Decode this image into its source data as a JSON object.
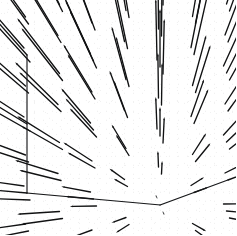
{
  "figure": {
    "kind": "3d-vector-field",
    "background_color": "#ffffff",
    "ink_color": "#111213",
    "width": 236,
    "height": 235
  },
  "axes": {
    "z": {
      "name": "z",
      "ticks": [
        "2",
        "1",
        "0",
        "-1",
        "-2"
      ],
      "tick_values": [
        2,
        1,
        0,
        -1,
        -2
      ],
      "range": [
        -2,
        2
      ],
      "minor_ticks_per_interval": 4
    },
    "y": {
      "name": "y",
      "ticks": [
        "-2",
        "-1",
        "0",
        "1",
        "2"
      ],
      "tick_values": [
        -2,
        -1,
        0,
        1,
        2
      ],
      "range": [
        -2,
        2
      ]
    },
    "x": {
      "name": "x",
      "ticks": [
        "2",
        "1",
        "0",
        "-1",
        "-2"
      ],
      "tick_values": [
        2,
        1,
        0,
        -1,
        -2
      ],
      "range": [
        -2,
        2
      ]
    }
  },
  "chart_data": {
    "type": "scatter",
    "title": "",
    "subtitle": "",
    "xlabel": "x",
    "ylabel": "y",
    "zlabel": "z",
    "xlim": [
      -2,
      2
    ],
    "ylim": [
      -2,
      2
    ],
    "zlim": [
      -2,
      2
    ],
    "grid": false,
    "legend": "none",
    "field": {
      "description": "3D vector field sampled on a regular cubic grid; arrows are short near the origin and grow toward the edges, pointing away from the centre (radially divergent).",
      "samples_per_axis": 9,
      "sample_coordinates": [
        -2,
        -1.5,
        -1,
        -0.5,
        0,
        0.5,
        1,
        1.5,
        2
      ],
      "vector_rule": "v(x,y,z) = (x, y, z)",
      "arrow_scale": 0.42,
      "total_arrows": 729
    },
    "tick_labels": {
      "x": [
        "2",
        "1",
        "0",
        "-1",
        "-2"
      ],
      "y": [
        "-2",
        "-1",
        "0",
        "1",
        "2"
      ],
      "z": [
        "2",
        "1",
        "0",
        "-1",
        "-2"
      ]
    },
    "projection": {
      "type": "axonometric",
      "origin_px": [
        160,
        205
      ],
      "x_axis_px": [
        68,
        -25
      ],
      "y_axis_px": [
        -133,
        -12
      ],
      "z_axis_px": [
        0,
        -138
      ]
    }
  }
}
